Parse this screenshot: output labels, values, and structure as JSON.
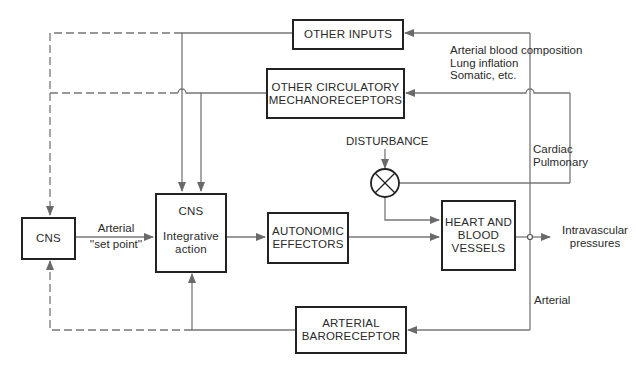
{
  "diagram": {
    "type": "block-diagram",
    "colors": {
      "line": "#777777",
      "box_border": "#222222",
      "text": "#2a2a2a",
      "background": "#ffffff"
    },
    "blocks": {
      "other_inputs": {
        "label": "OTHER INPUTS"
      },
      "other_mechanoreceptors": {
        "line1": "OTHER CIRCULATORY",
        "line2": "MECHANORECEPTORS"
      },
      "cns_setpoint": {
        "label": "CNS"
      },
      "cns_integrative": {
        "line1": "CNS",
        "line2": "Integrative",
        "line3": "action"
      },
      "autonomic_effectors": {
        "line1": "AUTONOMIC",
        "line2": "EFFECTORS"
      },
      "heart_vessels": {
        "line1": "HEART AND",
        "line2": "BLOOD",
        "line3": "VESSELS"
      },
      "arterial_baroreceptor": {
        "line1": "ARTERIAL",
        "line2": "BARORECEPTOR"
      }
    },
    "labels": {
      "setpoint_line1": "Arterial",
      "setpoint_line2": "''set point''",
      "disturbance": "DISTURBANCE",
      "other_inputs_sources": [
        "Arterial blood composition",
        "Lung inflation",
        "Somatic, etc."
      ],
      "mechanoreceptor_sources": [
        "Cardiac",
        "Pulmonary"
      ],
      "baroreceptor_source": "Arterial",
      "output_line1": "Intravascular",
      "output_line2": "pressures"
    },
    "connections": [
      {
        "from": "cns_setpoint",
        "to": "cns_integrative",
        "style": "solid",
        "label": "Arterial ''set point''"
      },
      {
        "from": "cns_integrative",
        "to": "autonomic_effectors",
        "style": "solid"
      },
      {
        "from": "autonomic_effectors",
        "to": "heart_vessels",
        "style": "solid"
      },
      {
        "from": "disturbance",
        "to": "summing_junction",
        "style": "solid"
      },
      {
        "from": "summing_junction",
        "to": "heart_vessels",
        "style": "solid"
      },
      {
        "from": "heart_vessels",
        "to": "intravascular_pressures",
        "style": "solid"
      },
      {
        "from": "intravascular_pressures",
        "to": "arterial_baroreceptor",
        "style": "solid",
        "label": "Arterial"
      },
      {
        "from": "intravascular_pressures",
        "to": "other_mechanoreceptors",
        "style": "solid",
        "label": "Cardiac Pulmonary"
      },
      {
        "from": "sources",
        "to": "other_inputs",
        "style": "solid",
        "label": "Arterial blood composition, Lung inflation, Somatic, etc."
      },
      {
        "from": "other_inputs",
        "to": "cns_integrative",
        "style": "solid"
      },
      {
        "from": "other_mechanoreceptors",
        "to": "cns_integrative",
        "style": "solid"
      },
      {
        "from": "intravascular_pressures",
        "to": "summing_junction",
        "style": "solid"
      },
      {
        "from": "arterial_baroreceptor",
        "to": "cns_integrative",
        "style": "solid"
      },
      {
        "from": "other_inputs",
        "to": "cns_setpoint",
        "style": "dashed"
      },
      {
        "from": "other_mechanoreceptors",
        "to": "cns_setpoint",
        "style": "dashed"
      },
      {
        "from": "arterial_baroreceptor",
        "to": "cns_setpoint",
        "style": "dashed"
      }
    ]
  }
}
